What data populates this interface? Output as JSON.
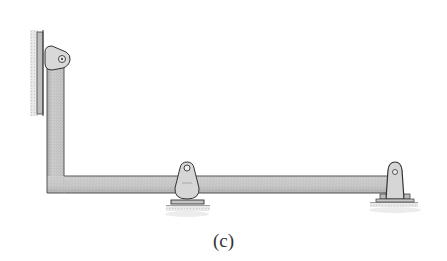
{
  "figure": {
    "caption": "(c)",
    "elements": [
      {
        "type": "wall",
        "side": "left"
      },
      {
        "type": "pin-support",
        "location": "top-left on wall"
      },
      {
        "type": "L-shaped-beam",
        "segments": [
          "vertical",
          "horizontal"
        ]
      },
      {
        "type": "rocker-support",
        "location": "mid-span"
      },
      {
        "type": "pin-support",
        "location": "right end"
      }
    ],
    "colors": {
      "beam_fill": "#c9c9c9",
      "beam_edge": "#555555",
      "support_fill": "#d6d6d6",
      "shadow": "#e6e6e6"
    }
  }
}
